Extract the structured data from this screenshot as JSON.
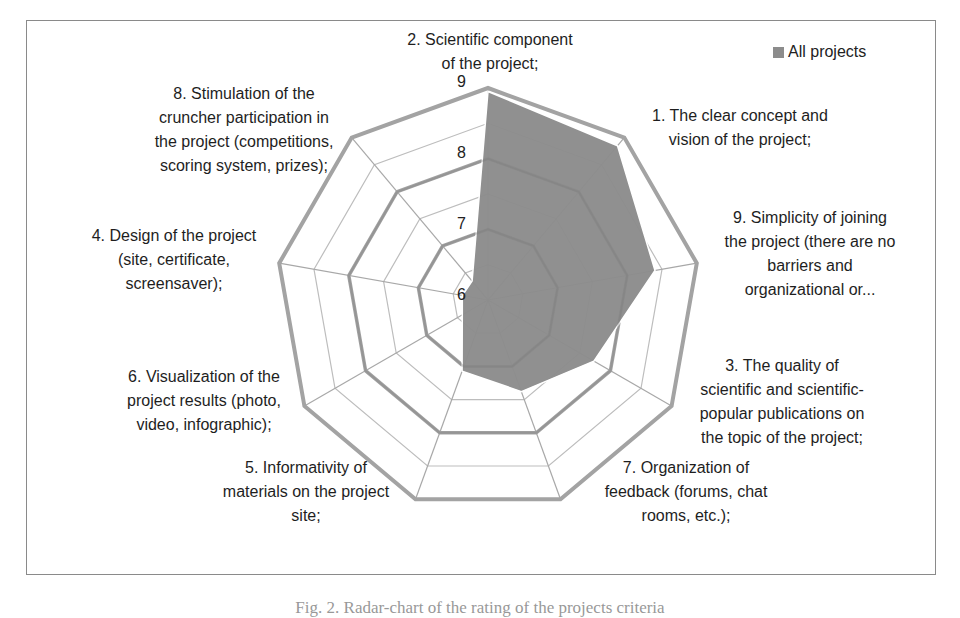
{
  "chart_data": {
    "type": "radar",
    "title": "",
    "series": [
      {
        "name": "All projects",
        "color": "#8c8c8c",
        "values": [
          8.95,
          8.85,
          8.4,
          7.73,
          7.38,
          7.07,
          6.42,
          6.37,
          6.35
        ]
      }
    ],
    "categories": [
      "2. Scientific component of the project;",
      "1. The clear concept and vision of the project;",
      "9. Simplicity of joining the project (there are no barriers and organizational or...",
      "3. The quality of scientific and scientific-popular publications on the topic of the project;",
      "7. Organization of feedback (forums, chat rooms, etc.);",
      "5. Informativity of materials on the project site;",
      "6. Visualization of the project results (photo, video, infographic);",
      "4. Design of the project (site, certificate, screensaver);",
      "8. Stimulation of the cruncher participation in the project (competitions, scoring system, prizes);"
    ],
    "axis_range": [
      6,
      9
    ],
    "major_ticks": [
      6,
      7,
      8,
      9
    ],
    "minor_step": 0.5,
    "tick_labels": [
      "6",
      "7",
      "8",
      "9"
    ],
    "legend_position": "top-right",
    "grid": true
  },
  "labels": {
    "axis2": [
      "2.  Scientific component",
      "of the project;"
    ],
    "axis1": [
      "1.  The clear concept and",
      "vision of the project;"
    ],
    "axis9": [
      "9.  Simplicity of joining",
      "the project (there are no",
      "barriers and",
      "organizational or..."
    ],
    "axis3": [
      "3.  The quality of",
      "scientific and scientific-",
      "popular publications on",
      "the topic of the project;"
    ],
    "axis7": [
      "7.  Organization of",
      "feedback (forums, chat",
      "rooms, etc.);"
    ],
    "axis5": [
      "5.  Informativity of",
      "materials on the project",
      "site;"
    ],
    "axis6": [
      "6.  Visualization of the",
      "project results (photo,",
      "video, infographic);"
    ],
    "axis4": [
      "4.  Design of the project",
      "(site, certificate,",
      "screensaver);"
    ],
    "axis8": [
      "8.  Stimulation of the",
      "cruncher participation in",
      "the project (competitions,",
      "scoring system, prizes);"
    ]
  },
  "legend": {
    "label": "All projects"
  },
  "caption": "Fig. 2. Radar-chart of the rating of the projects criteria"
}
